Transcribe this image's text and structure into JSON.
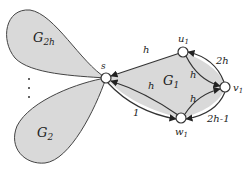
{
  "diagram": {
    "nodes": {
      "s": {
        "label": "s"
      },
      "u1": {
        "label": "u",
        "sub": "1"
      },
      "v1": {
        "label": "v",
        "sub": "1"
      },
      "w1": {
        "label": "w",
        "sub": "1"
      }
    },
    "regions": {
      "g2h": {
        "label": "G",
        "sub": "2h"
      },
      "g2": {
        "label": "G",
        "sub": "2"
      },
      "g1": {
        "label": "G",
        "sub": "1"
      }
    },
    "ellipsis": "⋮",
    "edges": {
      "u1_s": "h",
      "w1_s_upper": "h",
      "s_w1_lower": "1",
      "u1_v1_inner": "h",
      "v1_u1_outer": "2h",
      "w1_v1_inner": "h",
      "v1_w1_outer": "2h-1"
    },
    "colors": {
      "fill": "#d9d9d9",
      "stroke": "#333333",
      "node_fill": "#ffffff"
    }
  }
}
